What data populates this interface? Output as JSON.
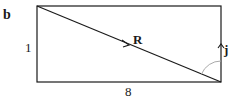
{
  "panel_label": "b",
  "labels": {
    "height": "1",
    "width": "8",
    "vector_r": "R",
    "unit_j": "j"
  },
  "geometry": {
    "rect": {
      "x": 37,
      "y": 6,
      "w": 184,
      "h": 76
    },
    "diagonal": {
      "from": "top-left",
      "to": "bottom-right"
    },
    "angle_arc_color": "#aaaaaa",
    "line_color": "#1a1a1a"
  }
}
